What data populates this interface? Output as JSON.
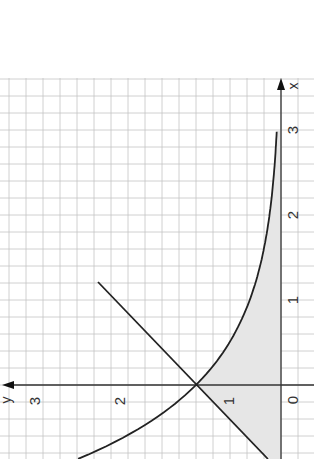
{
  "chart_data": {
    "type": "line",
    "orientation": "rotated 90° counter-clockwise (x-axis points up, y-axis points left)",
    "title": "",
    "xlabel": "x",
    "ylabel": "y",
    "x_ticks": [
      "0",
      "1",
      "2",
      "3"
    ],
    "y_ticks": [
      "0",
      "1",
      "2",
      "3"
    ],
    "xlim": [
      -0.87,
      3.6
    ],
    "ylim": [
      0,
      3.3
    ],
    "grid": true,
    "grid_step": 0.2,
    "series": [
      {
        "name": "y = e^(-x)",
        "x": [
          -0.87,
          -0.75,
          -0.5,
          -0.25,
          0,
          0.25,
          0.5,
          0.75,
          1,
          1.5,
          2,
          2.5,
          3
        ],
        "y": [
          2.39,
          2.12,
          1.65,
          1.28,
          1.0,
          0.78,
          0.61,
          0.47,
          0.37,
          0.22,
          0.14,
          0.08,
          0.05
        ]
      },
      {
        "name": "y = x + 1",
        "x": [
          -0.87,
          1.2
        ],
        "y": [
          0.13,
          2.2
        ]
      }
    ],
    "shaded_region": {
      "description": "Area under y = x + 1 for x < 0 and under y = e^(-x) for 0 ≤ x ≤ 3, above the x-axis",
      "x_range": [
        -0.87,
        3
      ],
      "color": "#e6e6e6"
    },
    "intersection": {
      "x": 0,
      "y": 1
    }
  },
  "labels": {
    "x_axis": "x",
    "y_axis": "y",
    "x_tick_0": "0",
    "x_tick_1": "1",
    "x_tick_2": "2",
    "x_tick_3": "3",
    "y_tick_1": "1",
    "y_tick_2": "2",
    "y_tick_3": "3"
  },
  "colors": {
    "grid": "#c4c4c4",
    "axis": "#333333",
    "curve": "#222222",
    "shade": "#e4e4e4"
  }
}
